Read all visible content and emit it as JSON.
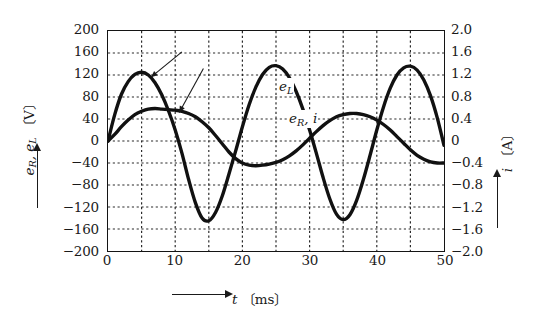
{
  "chart_data": {
    "type": "line",
    "title": "",
    "subtitle": "",
    "xlabel": "t",
    "xunit": "ms",
    "ylabel": "e_R, e_L",
    "yunit": "V",
    "y2label": "i",
    "y2unit": "A",
    "xlim": [
      0,
      50
    ],
    "ylim": [
      -200,
      200
    ],
    "y2lim": [
      -2.0,
      2.0
    ],
    "grid": true,
    "grid_style": "dotted",
    "legend_position": "in-plot-annotations",
    "x_ticks": [
      "0",
      "10",
      "20",
      "30",
      "40",
      "50"
    ],
    "x_tick_values": [
      0,
      10,
      20,
      30,
      40,
      50
    ],
    "x_gridline_values": [
      5,
      10,
      15,
      20,
      25,
      30,
      35,
      40,
      45
    ],
    "y_ticks": [
      "200",
      "160",
      "120",
      "80",
      "40",
      "0",
      "-40",
      "-80",
      "-120",
      "-160",
      "-200"
    ],
    "y_tick_values": [
      200,
      160,
      120,
      80,
      40,
      0,
      -40,
      -80,
      -120,
      -160,
      -200
    ],
    "y2_ticks": [
      "2.0",
      "1.6",
      "1.2",
      "0.8",
      "0.4",
      "0",
      "-0.4",
      "-0.8",
      "-1.2",
      "-1.6",
      "-2.0"
    ],
    "y2_tick_values": [
      2.0,
      1.6,
      1.2,
      0.8,
      0.4,
      0,
      -0.4,
      -0.8,
      -1.2,
      -1.6,
      -2.0
    ],
    "annotations": [
      {
        "name": "e_L",
        "text_main": "e",
        "text_sub": "L",
        "x": 11.0,
        "y": 162,
        "points_to_x": 6.4,
        "points_to_y": 116
      },
      {
        "name": "e_R, i",
        "text_main": "e",
        "text_sub": "R",
        "text_tail": ", i",
        "x": 14.2,
        "y": 132,
        "points_to_x": 10.6,
        "points_to_y": 52
      }
    ],
    "series": [
      {
        "name": "e_L",
        "axis": "left",
        "unit": "V",
        "color": "#111111",
        "linewidth": 3.4,
        "description": "Inductor voltage, decaying-transient sinusoid peaking early each cycle",
        "points": [
          [
            0,
            0
          ],
          [
            1,
            48
          ],
          [
            2,
            85
          ],
          [
            3,
            108
          ],
          [
            4,
            121
          ],
          [
            5,
            125
          ],
          [
            6,
            120
          ],
          [
            7,
            106
          ],
          [
            8,
            84
          ],
          [
            9,
            55
          ],
          [
            10,
            20
          ],
          [
            11,
            -22
          ],
          [
            12,
            -70
          ],
          [
            13,
            -112
          ],
          [
            14,
            -140
          ],
          [
            15,
            -145
          ],
          [
            16,
            -130
          ],
          [
            17,
            -100
          ],
          [
            18,
            -60
          ],
          [
            19,
            -18
          ],
          [
            20,
            26
          ],
          [
            21,
            66
          ],
          [
            22,
            98
          ],
          [
            23,
            121
          ],
          [
            24,
            134
          ],
          [
            25,
            137
          ],
          [
            26,
            131
          ],
          [
            27,
            115
          ],
          [
            28,
            90
          ],
          [
            29,
            58
          ],
          [
            30,
            20
          ],
          [
            31,
            -22
          ],
          [
            32,
            -66
          ],
          [
            33,
            -105
          ],
          [
            34,
            -133
          ],
          [
            35,
            -143
          ],
          [
            36,
            -134
          ],
          [
            37,
            -108
          ],
          [
            38,
            -70
          ],
          [
            39,
            -26
          ],
          [
            40,
            20
          ],
          [
            41,
            62
          ],
          [
            42,
            96
          ],
          [
            43,
            120
          ],
          [
            44,
            133
          ],
          [
            45,
            136
          ],
          [
            46,
            129
          ],
          [
            47,
            111
          ],
          [
            48,
            82
          ],
          [
            49,
            42
          ],
          [
            50,
            -8
          ]
        ]
      },
      {
        "name": "e_R",
        "axis": "left",
        "unit": "V",
        "color": "#111111",
        "linewidth": 3.4,
        "description": "Resistor voltage, proportional to current i; same waveform on right axis in amperes",
        "points": [
          [
            0,
            0
          ],
          [
            1,
            12
          ],
          [
            2,
            26
          ],
          [
            3,
            38
          ],
          [
            4,
            48
          ],
          [
            5,
            54
          ],
          [
            6,
            58
          ],
          [
            7,
            59
          ],
          [
            8,
            58
          ],
          [
            9,
            57
          ],
          [
            10,
            56
          ],
          [
            11,
            54
          ],
          [
            12,
            50
          ],
          [
            13,
            44
          ],
          [
            14,
            35
          ],
          [
            15,
            24
          ],
          [
            16,
            10
          ],
          [
            17,
            -5
          ],
          [
            18,
            -20
          ],
          [
            19,
            -32
          ],
          [
            20,
            -40
          ],
          [
            21,
            -44
          ],
          [
            22,
            -45
          ],
          [
            23,
            -44
          ],
          [
            24,
            -42
          ],
          [
            25,
            -39
          ],
          [
            26,
            -34
          ],
          [
            27,
            -27
          ],
          [
            28,
            -18
          ],
          [
            29,
            -7
          ],
          [
            30,
            5
          ],
          [
            31,
            17
          ],
          [
            32,
            28
          ],
          [
            33,
            37
          ],
          [
            34,
            44
          ],
          [
            35,
            48
          ],
          [
            36,
            50
          ],
          [
            37,
            50
          ],
          [
            38,
            48
          ],
          [
            39,
            44
          ],
          [
            40,
            38
          ],
          [
            41,
            30
          ],
          [
            42,
            20
          ],
          [
            43,
            8
          ],
          [
            44,
            -4
          ],
          [
            45,
            -16
          ],
          [
            46,
            -26
          ],
          [
            47,
            -33
          ],
          [
            48,
            -38
          ],
          [
            49,
            -40
          ],
          [
            50,
            -40
          ]
        ],
        "points_secondary_axis": [
          [
            0,
            0
          ],
          [
            5,
            0.54
          ],
          [
            9,
            0.57
          ],
          [
            14,
            0.35
          ],
          [
            18,
            -0.2
          ],
          [
            22,
            -0.45
          ],
          [
            27,
            -0.27
          ],
          [
            32,
            0.28
          ],
          [
            36,
            0.5
          ],
          [
            41,
            0.3
          ],
          [
            45,
            -0.16
          ],
          [
            50,
            -0.4
          ]
        ]
      }
    ]
  },
  "axes": {
    "left_title_main": "e",
    "left_title_sub1": "R",
    "left_title_mid": ", e",
    "left_title_sub2": "L",
    "left_title_unit": "〔V〕",
    "right_title_main": "i",
    "right_title_unit": "〔A〕",
    "bottom_title_main": "t",
    "bottom_title_unit": "〔ms〕"
  },
  "colors": {
    "curve": "#111111",
    "frame": "#141414",
    "grid": "#2b2b2b",
    "background": "#ffffff",
    "text": "#1a1a1a"
  }
}
